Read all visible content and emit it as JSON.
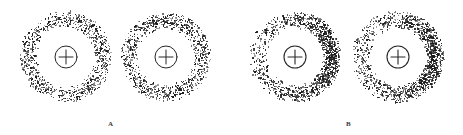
{
  "figure": {
    "background_color": "#ffffff",
    "width": 463,
    "height": 135,
    "dot_color": "#1a1a1a",
    "symbol_color": "#262626",
    "label_color": "#3a3a3a"
  },
  "panels": [
    {
      "id": "panel-a",
      "label": "A",
      "label_x": 108,
      "label_y": 121,
      "rings": [
        {
          "id": "ring-a1",
          "center_x": 66,
          "center_y": 57,
          "inner_radius": 29,
          "outer_radius": 46,
          "dot_count": 1150,
          "density_profile": "uniform",
          "asymmetry": 0.0,
          "dot_radius_min": 0.35,
          "dot_radius_max": 0.95,
          "seed": 1117,
          "symbol": {
            "name": "circled-plus",
            "radius": 11,
            "stroke_width": 1.0,
            "arm_length": 7
          }
        },
        {
          "id": "ring-a2",
          "center_x": 166,
          "center_y": 57,
          "inner_radius": 28,
          "outer_radius": 45,
          "dot_count": 1220,
          "density_profile": "uniform",
          "asymmetry": 0.0,
          "dot_radius_min": 0.35,
          "dot_radius_max": 0.95,
          "seed": 2243,
          "symbol": {
            "name": "circled-plus",
            "radius": 11,
            "stroke_width": 1.0,
            "arm_length": 7
          }
        }
      ]
    },
    {
      "id": "panel-b",
      "label": "B",
      "label_x": 346,
      "label_y": 121,
      "rings": [
        {
          "id": "ring-b1",
          "center_x": 295,
          "center_y": 57,
          "inner_radius": 28,
          "outer_radius": 46,
          "dot_count": 1500,
          "density_profile": "asymmetric-right",
          "asymmetry": 0.72,
          "dot_radius_min": 0.35,
          "dot_radius_max": 1.05,
          "seed": 3371,
          "symbol": {
            "name": "circled-plus",
            "radius": 11,
            "stroke_width": 1.1,
            "arm_length": 7
          }
        },
        {
          "id": "ring-b2",
          "center_x": 398,
          "center_y": 57,
          "inner_radius": 28,
          "outer_radius": 46,
          "dot_count": 1520,
          "density_profile": "asymmetric-right",
          "asymmetry": 0.7,
          "dot_radius_min": 0.35,
          "dot_radius_max": 1.05,
          "seed": 4457,
          "symbol": {
            "name": "circled-plus",
            "radius": 11,
            "stroke_width": 1.1,
            "arm_length": 7
          }
        }
      ]
    }
  ],
  "chart_data": {
    "type": "scatter",
    "title": "",
    "xlabel": "",
    "ylabel": "",
    "grid": false,
    "legend_position": "none",
    "series": [
      {
        "name": "A1",
        "panel": "A",
        "center": [
          66,
          57
        ],
        "radial_range": [
          29,
          46
        ],
        "n_points": 1150,
        "angular_density": "uniform",
        "peak_angle_deg": null,
        "contrast_ratio": 1.0
      },
      {
        "name": "A2",
        "panel": "A",
        "center": [
          166,
          57
        ],
        "radial_range": [
          28,
          45
        ],
        "n_points": 1220,
        "angular_density": "uniform",
        "peak_angle_deg": null,
        "contrast_ratio": 1.0
      },
      {
        "name": "B1",
        "panel": "B",
        "center": [
          295,
          57
        ],
        "radial_range": [
          28,
          46
        ],
        "n_points": 1500,
        "angular_density": "cosine-weighted",
        "peak_angle_deg": 0,
        "contrast_ratio": 6.1
      },
      {
        "name": "B2",
        "panel": "B",
        "center": [
          398,
          57
        ],
        "radial_range": [
          28,
          46
        ],
        "n_points": 1520,
        "angular_density": "cosine-weighted",
        "peak_angle_deg": 0,
        "contrast_ratio": 5.7
      }
    ],
    "annotations": [
      {
        "text": "A",
        "x": 108,
        "y": 121
      },
      {
        "text": "B",
        "x": 346,
        "y": 121
      }
    ]
  }
}
